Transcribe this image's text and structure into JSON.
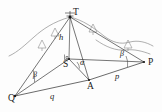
{
  "figure": {
    "width": 162,
    "height": 112,
    "background_color": "#fdfdfd",
    "line_color": "#2b2b2b",
    "terrain_color": "#8c8c8c"
  },
  "vertices": [
    {
      "id": "T",
      "label": "T",
      "x": 70,
      "y": 17,
      "label_x": 73,
      "label_y": 15,
      "role": "tower-top"
    },
    {
      "id": "S",
      "label": "S",
      "x": 69,
      "y": 59,
      "label_x": 63,
      "label_y": 67,
      "role": "height-foot"
    },
    {
      "id": "A",
      "label": "A",
      "x": 89,
      "y": 80,
      "label_x": 87,
      "label_y": 89,
      "role": "ground-station"
    },
    {
      "id": "P",
      "label": "P",
      "x": 144,
      "y": 62,
      "label_x": 148,
      "label_y": 65,
      "role": "ground-station"
    },
    {
      "id": "Q",
      "label": "Q",
      "x": 15,
      "y": 96,
      "label_x": 8,
      "label_y": 101,
      "role": "ground-station"
    }
  ],
  "segments": [
    {
      "id": "T-Q",
      "from": "T",
      "to": "Q",
      "kind": "sight-line"
    },
    {
      "id": "T-A",
      "from": "T",
      "to": "A",
      "kind": "sight-line"
    },
    {
      "id": "T-P",
      "from": "T",
      "to": "P",
      "kind": "sight-line"
    },
    {
      "id": "T-S",
      "from": "T",
      "to": "S",
      "kind": "height-line"
    },
    {
      "id": "S-Q",
      "from": "S",
      "to": "Q",
      "kind": "sight-line"
    },
    {
      "id": "S-A",
      "from": "S",
      "to": "A",
      "kind": "sight-line"
    },
    {
      "id": "S-P",
      "from": "S",
      "to": "P",
      "kind": "sight-line"
    },
    {
      "id": "Q-A",
      "from": "Q",
      "to": "A",
      "kind": "base-line"
    },
    {
      "id": "A-P",
      "from": "A",
      "to": "P",
      "kind": "base-line"
    }
  ],
  "measures": [
    {
      "id": "h",
      "label": "h",
      "x": 61,
      "y": 40,
      "describes": "vertical height T to S"
    },
    {
      "id": "p",
      "label": "p",
      "x": 117,
      "y": 79,
      "describes": "horizontal distance A to P"
    },
    {
      "id": "q",
      "label": "q",
      "x": 52,
      "y": 99,
      "describes": "horizontal distance Q to A"
    }
  ],
  "angles": [
    {
      "id": "alpha-at-A",
      "label": "α",
      "x": 82,
      "y": 65,
      "at_vertex": "S",
      "describes": "elevation angle at A"
    },
    {
      "id": "beta-at-Q",
      "label": "β",
      "x": 35,
      "y": 77,
      "at_vertex": "Q",
      "describes": "horizontal angle at Q"
    },
    {
      "id": "beta-at-P",
      "label": "β",
      "x": 122,
      "y": 56,
      "at_vertex": "P",
      "describes": "horizontal angle at P"
    }
  ],
  "right_angle": {
    "id": "right-angle-at-S",
    "at_vertex": "S",
    "describes": "T-S perpendicular to ground plane"
  },
  "terrain": {
    "contours": [
      {
        "id": "left-ridge",
        "path": "M 9,56 C 18,52 26,44 34,37 C 43,29 53,22 70,17"
      },
      {
        "id": "right-ridge",
        "path": "M 70,17 C 83,20 94,28 104,36 C 112,42 120,45 130,42 C 138,40 146,42 153,46"
      },
      {
        "id": "lower-slope",
        "path": "M 96,40 C 106,47 116,51 126,50 C 134,49 142,51 150,54"
      }
    ],
    "hill_markers": [
      {
        "id": "hill-1",
        "x": 42,
        "y": 45,
        "size": 6
      },
      {
        "id": "hill-2",
        "x": 55,
        "y": 33,
        "size": 6
      },
      {
        "id": "hill-3",
        "x": 93,
        "y": 29,
        "size": 6
      },
      {
        "id": "hill-4",
        "x": 128,
        "y": 45,
        "size": 6
      }
    ]
  }
}
